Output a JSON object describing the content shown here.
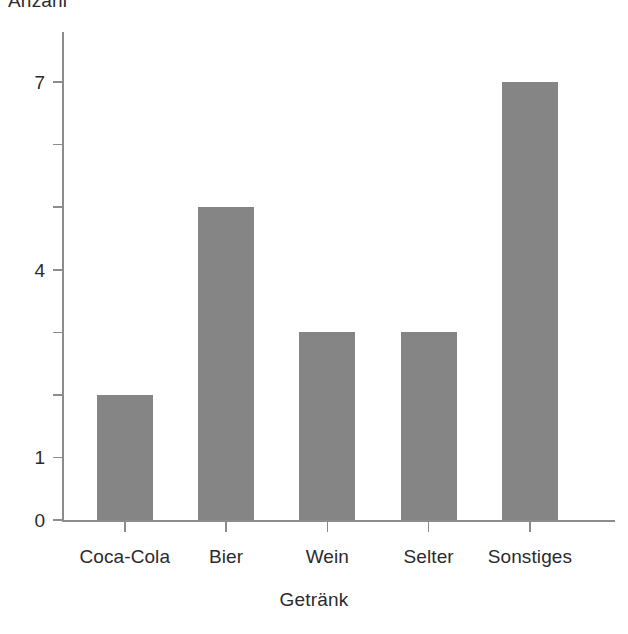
{
  "chart_data": {
    "type": "bar",
    "title": "",
    "xlabel": "Getränk",
    "ylabel": "Anzahl",
    "categories": [
      "Coca-Cola",
      "Bier",
      "Wein",
      "Selter",
      "Sonstiges"
    ],
    "values": [
      2,
      5,
      3,
      3,
      7
    ],
    "ylim": [
      0,
      7.8
    ],
    "y_ticks": [
      {
        "value": 0,
        "label": "0"
      },
      {
        "value": 1,
        "label": "1"
      },
      {
        "value": 2,
        "label": ""
      },
      {
        "value": 3,
        "label": ""
      },
      {
        "value": 4,
        "label": "4"
      },
      {
        "value": 5,
        "label": ""
      },
      {
        "value": 6,
        "label": ""
      },
      {
        "value": 7,
        "label": "7"
      }
    ],
    "grid": false,
    "legend": "none",
    "bar_color": "#858585",
    "axis_color": "#8c8c8c",
    "text_color": "#2b2b2b",
    "background": "#ffffff"
  }
}
